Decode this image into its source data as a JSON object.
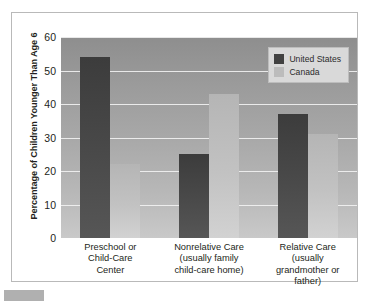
{
  "chart_data": {
    "type": "bar",
    "title": "",
    "xlabel": "",
    "ylabel": "Percentage of Children Younger Than Age 6",
    "ylim": [
      0,
      60
    ],
    "yticks": [
      0,
      10,
      20,
      30,
      40,
      50,
      60
    ],
    "grid": true,
    "legend_position": "top-right",
    "categories": [
      "Preschool or\nChild-Care\nCenter",
      "Nonrelative Care\n(usually family\nchild-care home)",
      "Relative Care\n(usually\ngrandmother or\nfather)"
    ],
    "category_lines": [
      [
        "Preschool or",
        "Child-Care",
        "Center"
      ],
      [
        "Nonrelative Care",
        "(usually family",
        "child-care home)"
      ],
      [
        "Relative Care",
        "(usually",
        "grandmother or",
        "father)"
      ]
    ],
    "series": [
      {
        "name": "United States",
        "color": "#414141",
        "values": [
          54,
          25,
          37
        ]
      },
      {
        "name": "Canada",
        "color": "#bcbcbc",
        "values": [
          22,
          43,
          31
        ]
      }
    ]
  },
  "legend": {
    "items": [
      {
        "label": "United States"
      },
      {
        "label": "Canada"
      }
    ]
  },
  "axis": {
    "y_title": "Percentage of Children Younger Than Age 6",
    "y_ticks": [
      "60",
      "50",
      "40",
      "30",
      "20",
      "10",
      "0"
    ]
  }
}
